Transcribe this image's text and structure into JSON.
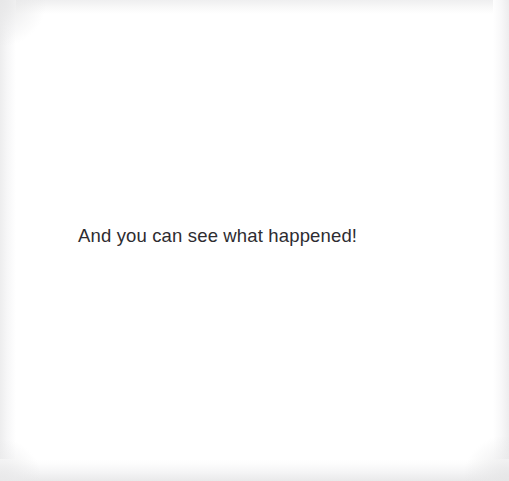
{
  "page": {
    "kind": "scanned-book-page",
    "width": 509,
    "height": 481,
    "background_color": "#ffffff",
    "edge_shadow_color": "#e8e8e9"
  },
  "content": {
    "body_text": "And you can see what happened!",
    "text_color": "#2e2c30",
    "text_align": "left",
    "text_left_px": 78,
    "text_baseline_px": 244,
    "font_size_px": 18.5
  }
}
